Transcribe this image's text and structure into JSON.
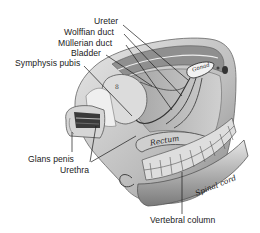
{
  "diagram": {
    "type": "anatomical-illustration",
    "labels": {
      "ureter": "Ureter",
      "wolffian_duct": "Wolffian duct",
      "mullerian_duct": "Müllerian duct",
      "bladder": "Bladder",
      "symphysis_pubis": "Symphysis pubis",
      "glans_penis": "Glans penis",
      "urethra": "Urethra",
      "vertebral_column": "Vertebral column"
    },
    "inline_labels": {
      "rectum": "Rectum",
      "spinal_cord": "Spinal cord",
      "gonad": "Gonad"
    },
    "colors": {
      "background": "#ffffff",
      "text": "#1a1a1a",
      "tissue_light": "#d9d9d9",
      "tissue_mid": "#a8a8a8",
      "tissue_dark": "#555555",
      "leader_line": "#1a1a1a"
    }
  }
}
